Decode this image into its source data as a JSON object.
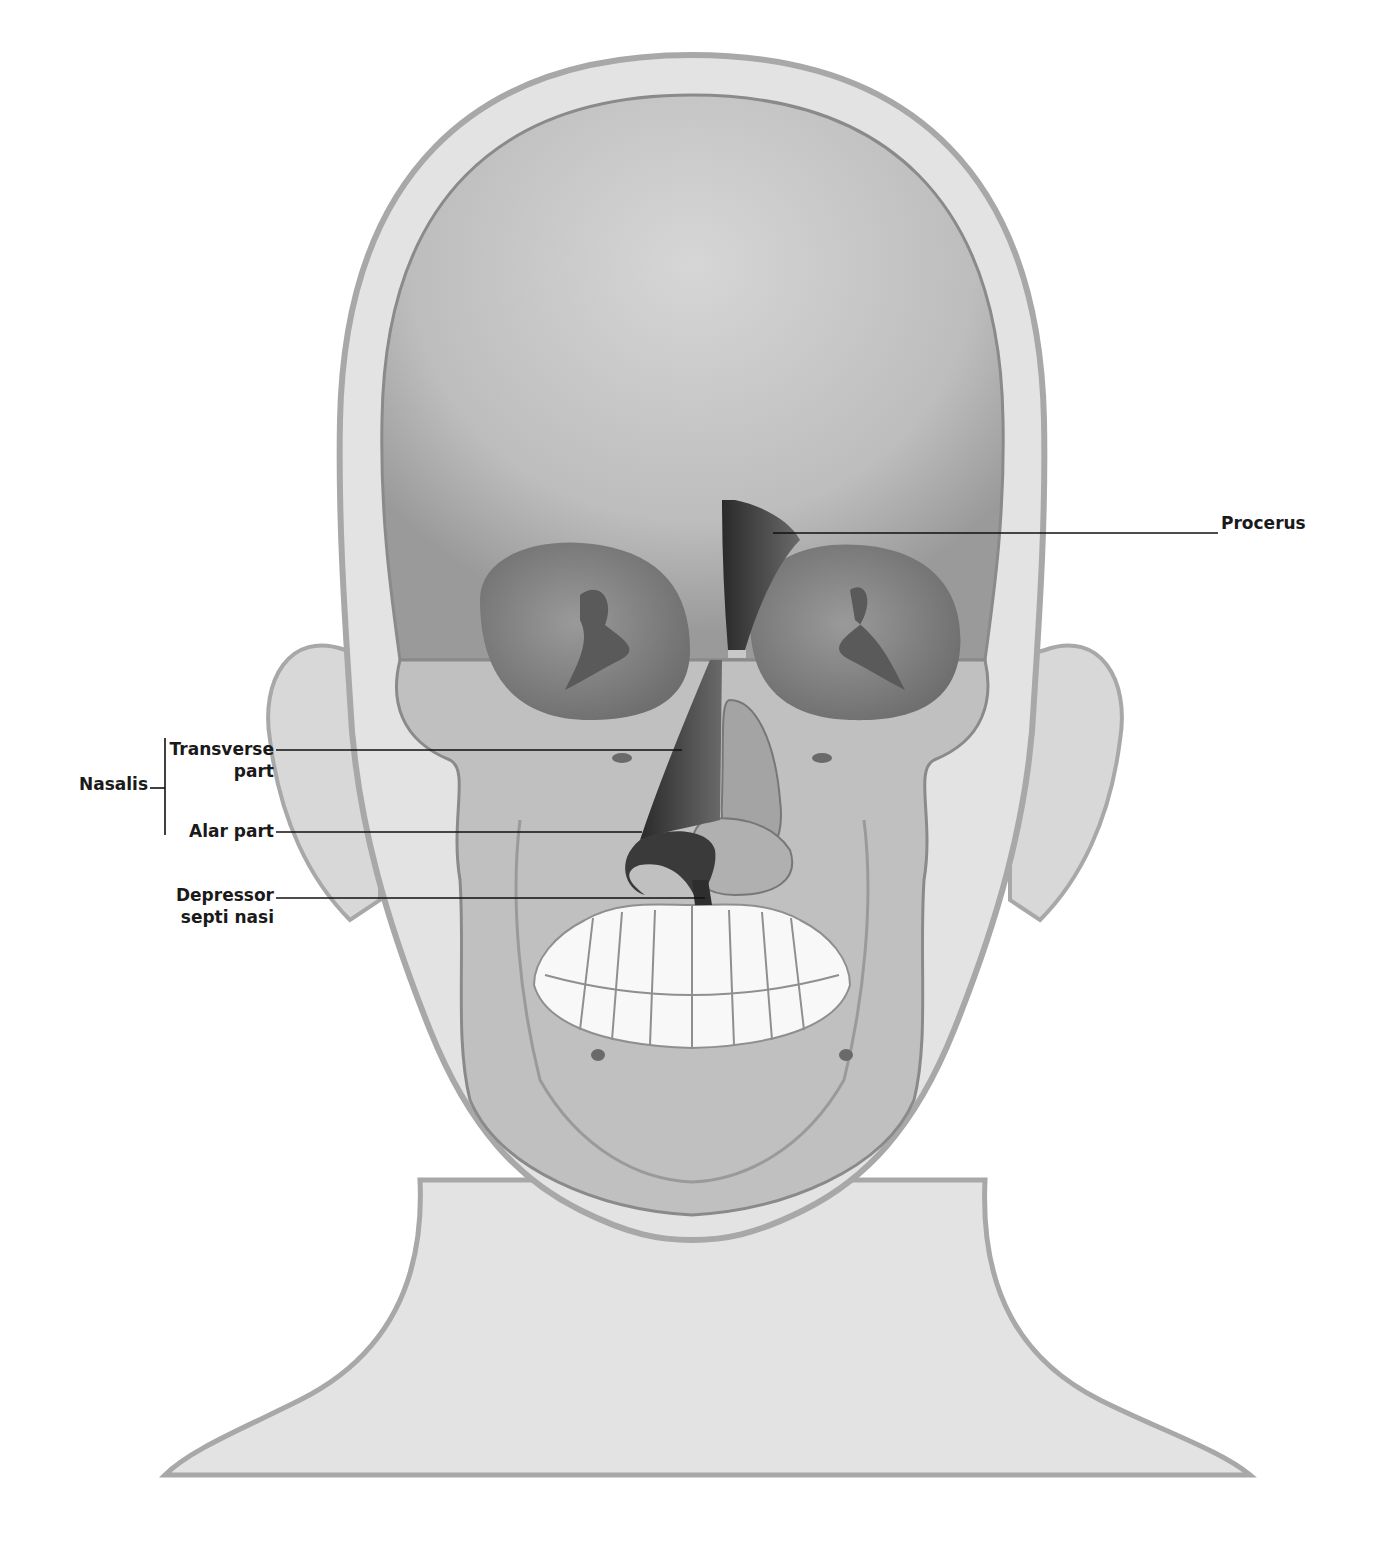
{
  "figure": {
    "colors": {
      "skin_fill": "#e3e3e3",
      "skin_outline": "#a8a8a8",
      "skull_fill": "#c4c4c4",
      "skull_dark": "#8a8a8a",
      "orbit": "#8c8c8c",
      "muscle": "#3a3a3a",
      "teeth": "#f8f8f8",
      "leader_line": "#111111"
    }
  },
  "labels": {
    "procerus": "Procerus",
    "nasalis": "Nasalis",
    "transverse_line1": "Transverse",
    "transverse_line2": "part",
    "alar": "Alar part",
    "depressor_line1": "Depressor",
    "depressor_line2": "septi nasi"
  }
}
